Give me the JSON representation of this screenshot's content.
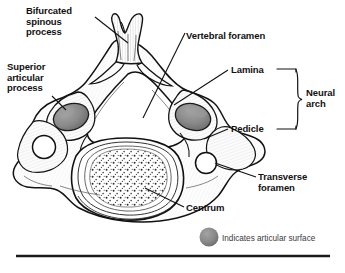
{
  "figure": {
    "background_color": "#ffffff",
    "outline_color": "#111111",
    "articular_surface_color": "#8a8a8a",
    "bone_fill_color": "#fdfdfd"
  },
  "labels": {
    "bifurcated_spinous_process": "Bifurcated\nspinous\nprocess",
    "superior_articular_process": "Superior\narticular\nprocess",
    "vertebral_foramen": "Vertebral foramen",
    "lamina": "Lamina",
    "pedicle": "Pedicle",
    "neural_arch": "Neural\narch",
    "transverse_foramen": "Transverse\nforamen",
    "centrum": "Centrum"
  },
  "legend": {
    "swatch_color": "#8a8a8a",
    "text": "Indicates articular surface"
  }
}
